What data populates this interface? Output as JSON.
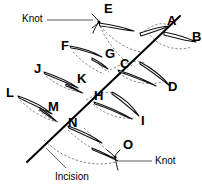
{
  "figure": {
    "line_color": "#000000",
    "stroke_color": "#111111",
    "dash_color": "#6b6b6b",
    "background": "#ffffff",
    "width": 202,
    "height": 189
  },
  "incision": {
    "label": "Incision",
    "x1": 27,
    "y1": 162,
    "x2": 180,
    "y2": 16,
    "leader": {
      "x1": 66,
      "y1": 168,
      "x2": 46,
      "y2": 148
    }
  },
  "knots": [
    {
      "id": "knot-top",
      "label": "Knot",
      "suture": "E",
      "text_x": 22,
      "text_y": 16,
      "leader": {
        "x1": 47,
        "y1": 20,
        "x2": 93,
        "y2": 20
      },
      "marker_x": 97,
      "marker_y": 21
    },
    {
      "id": "knot-bottom",
      "label": "Knot",
      "suture": "O",
      "text_x": 155,
      "text_y": 158,
      "leader": {
        "x1": 152,
        "y1": 161,
        "x2": 117,
        "y2": 161
      },
      "marker_x": 113,
      "marker_y": 157
    }
  ],
  "sutures": [
    {
      "letter": "A",
      "lx": 167,
      "ly": 20
    },
    {
      "letter": "B",
      "lx": 192,
      "ly": 36
    },
    {
      "letter": "C",
      "lx": 120,
      "ly": 63
    },
    {
      "letter": "D",
      "lx": 168,
      "ly": 86
    },
    {
      "letter": "E",
      "lx": 104,
      "ly": 7
    },
    {
      "letter": "F",
      "lx": 61,
      "ly": 45
    },
    {
      "letter": "G",
      "lx": 106,
      "ly": 53
    },
    {
      "letter": "H",
      "lx": 96,
      "ly": 95
    },
    {
      "letter": "I",
      "lx": 141,
      "ly": 120
    },
    {
      "letter": "J",
      "lx": 34,
      "ly": 68
    },
    {
      "letter": "K",
      "lx": 78,
      "ly": 78
    },
    {
      "letter": "L",
      "lx": 7,
      "ly": 92
    },
    {
      "letter": "M",
      "lx": 49,
      "ly": 106
    },
    {
      "letter": "N",
      "lx": 69,
      "ly": 122
    },
    {
      "letter": "O",
      "lx": 124,
      "ly": 144
    }
  ]
}
